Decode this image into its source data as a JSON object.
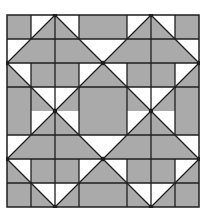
{
  "diagram": {
    "type": "quilt-pattern",
    "blocks_across": 2,
    "blocks_down": 2,
    "units_per_block": 4,
    "colors": {
      "fill": "#aaaaaa",
      "background": "#ffffff",
      "line": "#1e1e1e"
    },
    "block": {
      "name": "repeat-block",
      "shapes": [
        {
          "kind": "square",
          "cell": [
            0,
            0
          ],
          "fill": "fill"
        },
        {
          "kind": "square",
          "cell": [
            3,
            0
          ],
          "fill": "fill"
        },
        {
          "kind": "square",
          "cell": [
            1,
            2
          ],
          "fill": "fill"
        },
        {
          "kind": "square",
          "cell": [
            2,
            2
          ],
          "fill": "fill"
        },
        {
          "kind": "square",
          "cell": [
            0,
            3
          ],
          "fill": "fill"
        },
        {
          "kind": "square",
          "cell": [
            3,
            3
          ],
          "fill": "fill"
        },
        {
          "kind": "triangle",
          "name": "top-large-triangle",
          "points": [
            [
              2,
              0
            ],
            [
              0,
              2
            ],
            [
              4,
              2
            ]
          ],
          "fill": "fill"
        },
        {
          "kind": "triangle",
          "name": "left-lower-triangle",
          "points": [
            [
              0,
              2
            ],
            [
              1,
              3
            ],
            [
              0,
              3
            ]
          ],
          "fill": "fill"
        },
        {
          "kind": "triangle",
          "name": "right-lower-triangle",
          "points": [
            [
              4,
              2
            ],
            [
              3,
              3
            ],
            [
              4,
              3
            ]
          ],
          "fill": "fill"
        },
        {
          "kind": "triangle",
          "name": "bottom-left-triangle",
          "points": [
            [
              1,
              3
            ],
            [
              2,
              4
            ],
            [
              1,
              4
            ]
          ],
          "fill": "fill"
        },
        {
          "kind": "triangle",
          "name": "bottom-right-triangle",
          "points": [
            [
              3,
              3
            ],
            [
              2,
              4
            ],
            [
              3,
              4
            ]
          ],
          "fill": "fill"
        }
      ],
      "lines": [
        [
          [
            0,
            1
          ],
          [
            4,
            1
          ]
        ],
        [
          [
            0,
            2
          ],
          [
            4,
            2
          ]
        ],
        [
          [
            0,
            3
          ],
          [
            4,
            3
          ]
        ],
        [
          [
            1,
            0
          ],
          [
            1,
            1
          ]
        ],
        [
          [
            3,
            0
          ],
          [
            3,
            1
          ]
        ],
        [
          [
            1,
            2
          ],
          [
            1,
            4
          ]
        ],
        [
          [
            3,
            2
          ],
          [
            3,
            4
          ]
        ],
        [
          [
            2,
            0
          ],
          [
            2,
            4
          ]
        ],
        [
          [
            2,
            0
          ],
          [
            0,
            2
          ]
        ],
        [
          [
            2,
            0
          ],
          [
            4,
            2
          ]
        ],
        [
          [
            0,
            2
          ],
          [
            2,
            4
          ]
        ],
        [
          [
            4,
            2
          ],
          [
            2,
            4
          ]
        ]
      ],
      "dots": [
        [
          2,
          0
        ],
        [
          0,
          2
        ],
        [
          4,
          2
        ],
        [
          2,
          4
        ]
      ]
    }
  }
}
